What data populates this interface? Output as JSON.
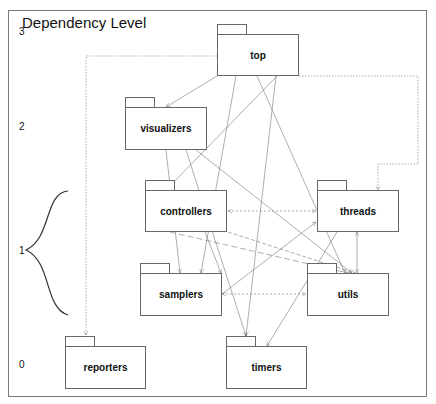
{
  "diagram": {
    "title": "Dependency Level",
    "levels": [
      {
        "label": "3",
        "y": 31
      },
      {
        "label": "2",
        "y": 126
      },
      {
        "label": "1",
        "y": 250
      },
      {
        "label": "0",
        "y": 364
      }
    ],
    "packages": [
      {
        "id": "top",
        "label": "top",
        "level": 3,
        "x": 217,
        "y": 24,
        "w": 82,
        "h": 52
      },
      {
        "id": "visualizers",
        "label": "visualizers",
        "level": 2,
        "x": 125,
        "y": 97,
        "w": 82,
        "h": 53
      },
      {
        "id": "controllers",
        "label": "controllers",
        "level": 1,
        "x": 145,
        "y": 180,
        "w": 82,
        "h": 52
      },
      {
        "id": "threads",
        "label": "threads",
        "level": 1,
        "x": 317,
        "y": 180,
        "w": 82,
        "h": 52
      },
      {
        "id": "samplers",
        "label": "samplers",
        "level": 1,
        "x": 140,
        "y": 263,
        "w": 82,
        "h": 53
      },
      {
        "id": "utils",
        "label": "utils",
        "level": 1,
        "x": 307,
        "y": 263,
        "w": 82,
        "h": 53
      },
      {
        "id": "reporters",
        "label": "reporters",
        "level": 0,
        "x": 65,
        "y": 336,
        "w": 81,
        "h": 53
      },
      {
        "id": "timers",
        "label": "timers",
        "level": 0,
        "x": 226,
        "y": 336,
        "w": 81,
        "h": 53
      }
    ],
    "edges": [
      {
        "from": "top",
        "to": "reporters",
        "style": "dotted"
      },
      {
        "from": "top",
        "to": "threads",
        "style": "dotted"
      },
      {
        "from": "top",
        "to": "visualizers",
        "style": "solid"
      },
      {
        "from": "top",
        "to": "controllers",
        "style": "solid"
      },
      {
        "from": "top",
        "to": "samplers",
        "style": "solid"
      },
      {
        "from": "top",
        "to": "utils",
        "style": "solid"
      },
      {
        "from": "top",
        "to": "timers",
        "style": "solid"
      },
      {
        "from": "visualizers",
        "to": "samplers",
        "style": "solid"
      },
      {
        "from": "visualizers",
        "to": "utils",
        "style": "solid"
      },
      {
        "from": "visualizers",
        "to": "timers",
        "style": "solid"
      },
      {
        "from": "controllers",
        "to": "threads",
        "style": "dotted-bidirectional"
      },
      {
        "from": "controllers",
        "to": "samplers",
        "style": "solid"
      },
      {
        "from": "controllers",
        "to": "utils",
        "style": "dashed"
      },
      {
        "from": "threads",
        "to": "utils",
        "style": "solid-bidirectional"
      },
      {
        "from": "threads",
        "to": "timers",
        "style": "solid"
      },
      {
        "from": "samplers",
        "to": "threads",
        "style": "solid"
      },
      {
        "from": "samplers",
        "to": "utils",
        "style": "dotted"
      },
      {
        "from": "utils",
        "to": "samplers",
        "style": "dashed"
      }
    ],
    "level1_brace_label": "1"
  }
}
